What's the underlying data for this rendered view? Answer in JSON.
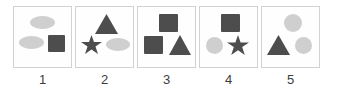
{
  "diagram": {
    "type": "shape-set-multiple-choice",
    "colors": {
      "dark_shape": "#4d4d4d",
      "light_shape": "#cfcfcf",
      "box_border": "#d2d2d2",
      "box_fill": "#fefefe",
      "label_text": "#3b3b3b",
      "background": "#ffffff"
    },
    "options": [
      {
        "label": "1",
        "shapes": [
          {
            "name": "ellipse",
            "shade": "light",
            "x": 16,
            "y": 9,
            "w": 25,
            "h": 13
          },
          {
            "name": "ellipse",
            "shade": "light",
            "x": 5,
            "y": 29,
            "w": 25,
            "h": 13
          },
          {
            "name": "square",
            "shade": "dark",
            "x": 34,
            "y": 28,
            "w": 17,
            "h": 17
          }
        ]
      },
      {
        "label": "2",
        "shapes": [
          {
            "name": "triangle",
            "shade": "dark",
            "x": 19,
            "y": 7,
            "w": 23,
            "h": 20
          },
          {
            "name": "star",
            "shade": "dark",
            "x": 5,
            "y": 28,
            "w": 21,
            "h": 20
          },
          {
            "name": "ellipse",
            "shade": "light",
            "x": 30,
            "y": 31,
            "w": 24,
            "h": 13
          }
        ]
      },
      {
        "label": "3",
        "shapes": [
          {
            "name": "square",
            "shade": "dark",
            "x": 21,
            "y": 7,
            "w": 19,
            "h": 18
          },
          {
            "name": "square",
            "shade": "dark",
            "x": 6,
            "y": 29,
            "w": 19,
            "h": 18
          },
          {
            "name": "triangle",
            "shade": "dark",
            "x": 31,
            "y": 28,
            "w": 22,
            "h": 20
          }
        ]
      },
      {
        "label": "4",
        "shapes": [
          {
            "name": "square",
            "shade": "dark",
            "x": 21,
            "y": 7,
            "w": 19,
            "h": 18
          },
          {
            "name": "circle",
            "shade": "light",
            "x": 6,
            "y": 30,
            "w": 17,
            "h": 17
          },
          {
            "name": "star",
            "shade": "dark",
            "x": 27,
            "y": 28,
            "w": 22,
            "h": 21
          }
        ]
      },
      {
        "label": "5",
        "shapes": [
          {
            "name": "circle",
            "shade": "light",
            "x": 22,
            "y": 7,
            "w": 18,
            "h": 18
          },
          {
            "name": "triangle",
            "shade": "dark",
            "x": 5,
            "y": 28,
            "w": 23,
            "h": 20
          },
          {
            "name": "circle",
            "shade": "light",
            "x": 33,
            "y": 30,
            "w": 17,
            "h": 17
          }
        ]
      }
    ]
  }
}
